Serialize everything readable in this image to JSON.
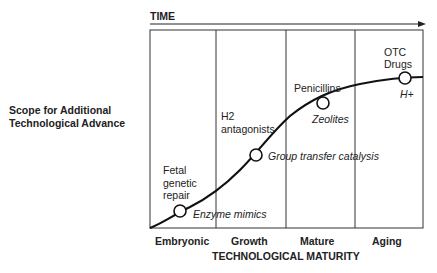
{
  "diagram": {
    "time_label": "TIME",
    "y_axis_label_line1": "Scope for Additional",
    "y_axis_label_line2": "Technological Advance",
    "x_axis_title": "TECHNOLOGICAL MATURITY",
    "stages": [
      "Embryonic",
      "Growth",
      "Mature",
      "Aging"
    ],
    "points": [
      {
        "above": [
          "Fetal",
          "genetic",
          "repair"
        ],
        "below": "Enzyme mimics"
      },
      {
        "above": [
          "H2",
          "antagonists"
        ],
        "below": "Group transfer catalysis"
      },
      {
        "above": [
          "Penicillins"
        ],
        "below": "Zeolites"
      },
      {
        "above": [
          "OTC",
          "Drugs"
        ],
        "below": "H+"
      }
    ],
    "colors": {
      "line": "#1a1a1a",
      "frame": "#333333",
      "background": "#ffffff"
    }
  }
}
